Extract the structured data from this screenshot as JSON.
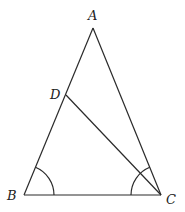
{
  "diagram": {
    "type": "triangle",
    "colors": {
      "stroke": "#2a2a2a",
      "background": "#ffffff",
      "label": "#222222"
    },
    "points": {
      "A": {
        "label": "A",
        "x": 93,
        "y": 28
      },
      "B": {
        "label": "B",
        "x": 24,
        "y": 195
      },
      "C": {
        "label": "C",
        "x": 161,
        "y": 195
      },
      "D": {
        "label": "D",
        "x": 66,
        "y": 95
      }
    },
    "segments": [
      "AB",
      "AC",
      "BC",
      "DC"
    ],
    "angle_marks": [
      {
        "vertex": "B",
        "between": [
          "A",
          "C"
        ]
      },
      {
        "vertex": "C",
        "between": [
          "B",
          "A"
        ]
      }
    ]
  }
}
